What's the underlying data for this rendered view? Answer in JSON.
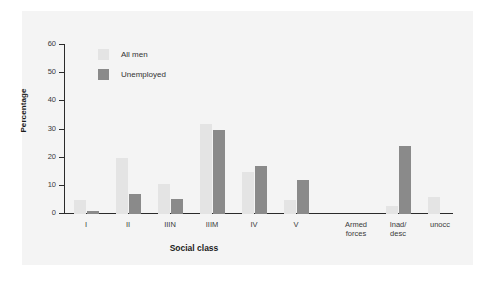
{
  "figure": {
    "y_axis_title": "Percentage",
    "x_axis_title": "Social class"
  },
  "legend": {
    "position": "inside-top-left",
    "items": [
      {
        "label": "All men",
        "color": "#e4e4e4",
        "swatch_name": "legend-swatch-all-men"
      },
      {
        "label": "Unemployed",
        "color": "#8a8a8a",
        "swatch_name": "legend-swatch-unemployed"
      }
    ]
  },
  "y_ticks": [
    {
      "label": "0",
      "value": 0
    },
    {
      "label": "10",
      "value": 10
    },
    {
      "label": "20",
      "value": 20
    },
    {
      "label": "30",
      "value": 30
    },
    {
      "label": "40",
      "value": 40
    },
    {
      "label": "50",
      "value": 50
    },
    {
      "label": "60",
      "value": 60
    }
  ],
  "chart_data": {
    "type": "bar",
    "title": "",
    "subtitle": "",
    "xlabel": "Social class",
    "ylabel": "Percentage",
    "ylim": [
      0,
      60
    ],
    "ytick_step": 10,
    "grid": false,
    "legend_position": "upper left (inside plot)",
    "categories": [
      "I",
      "II",
      "IIIN",
      "IIIM",
      "IV",
      "V",
      "Armed\nforces",
      "Inad/\ndesc",
      "unocc"
    ],
    "series": [
      {
        "name": "All men",
        "color": "#e4e4e4",
        "values": [
          5,
          20,
          10.5,
          32,
          15,
          5,
          0,
          3,
          6
        ]
      },
      {
        "name": "Unemployed",
        "color": "#8a8a8a",
        "values": [
          1,
          7,
          5.5,
          30,
          17,
          12,
          0,
          24,
          0
        ]
      }
    ]
  },
  "colors": {
    "bar_light": "#e4e4e4",
    "bar_dark": "#8a8a8a",
    "axis": "#2b2b2b",
    "panel_background": "#f4f4f4",
    "page_background": "#ffffff",
    "text": "#3a3a3a"
  }
}
